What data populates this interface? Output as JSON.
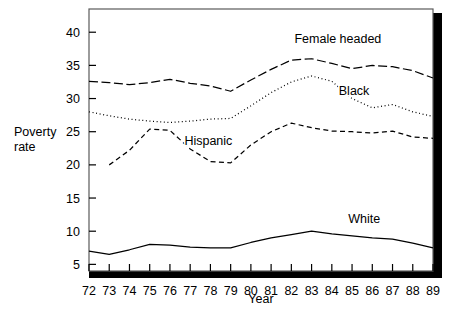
{
  "chart_data": {
    "type": "line",
    "title": "",
    "subtitle": "",
    "xlabel": "Year",
    "ylabel": "Poverty rate",
    "ylabel_line1": "Poverty",
    "ylabel_line2": "rate",
    "grid": false,
    "legend_position": "inline-annotations",
    "xlim": [
      72,
      89
    ],
    "ylim": [
      4.0,
      43.5
    ],
    "yticks": [
      5,
      10,
      15,
      20,
      25,
      30,
      35,
      40
    ],
    "ytick_labels": [
      "5",
      "10",
      "15",
      "20",
      "25",
      "30",
      "35",
      "40"
    ],
    "x": [
      72,
      73,
      74,
      75,
      76,
      77,
      78,
      79,
      80,
      81,
      82,
      83,
      84,
      85,
      86,
      87,
      88,
      89
    ],
    "categories": [
      "72",
      "73",
      "74",
      "75",
      "76",
      "77",
      "78",
      "79",
      "80",
      "81",
      "82",
      "83",
      "84",
      "85",
      "86",
      "87",
      "88",
      "89"
    ],
    "series": [
      {
        "name": "Female headed",
        "label": "Female headed",
        "style": "dash-dot",
        "color": "#000000",
        "values": [
          32.6,
          32.4,
          32.1,
          32.4,
          32.9,
          32.3,
          31.9,
          31.1,
          32.8,
          34.4,
          35.8,
          36.0,
          35.3,
          34.5,
          35.0,
          34.8,
          34.2,
          33.1
        ]
      },
      {
        "name": "Black",
        "label": "Black",
        "style": "dotted",
        "color": "#000000",
        "values": [
          28.0,
          27.4,
          26.9,
          26.6,
          26.4,
          26.6,
          26.9,
          27.0,
          28.9,
          30.9,
          32.5,
          33.4,
          32.6,
          30.0,
          28.6,
          29.1,
          28.0,
          27.3
        ]
      },
      {
        "name": "Hispanic",
        "label": "Hispanic",
        "style": "dashed",
        "color": "#000000",
        "values": [
          null,
          20.0,
          22.2,
          25.4,
          25.2,
          22.4,
          20.5,
          20.3,
          23.0,
          25.0,
          26.3,
          25.6,
          25.1,
          25.0,
          24.8,
          25.1,
          24.2,
          24.0
        ]
      },
      {
        "name": "White",
        "label": "White",
        "style": "solid",
        "color": "#000000",
        "values": [
          7.0,
          6.5,
          7.2,
          8.0,
          7.9,
          7.6,
          7.5,
          7.5,
          8.3,
          9.0,
          9.5,
          10.0,
          9.6,
          9.3,
          9.0,
          8.8,
          8.2,
          7.5
        ]
      }
    ],
    "annotations": [
      {
        "name": "female-headed-label",
        "text": "Female headed",
        "x": 84.3,
        "y": 38.3
      },
      {
        "name": "black-label",
        "text": "Black",
        "x": 85.1,
        "y": 30.5
      },
      {
        "name": "hispanic-label",
        "text": "Hispanic",
        "x": 77.9,
        "y": 23.0
      },
      {
        "name": "white-label",
        "text": "White",
        "x": 85.6,
        "y": 11.2
      }
    ]
  },
  "axes": {
    "x_axis_title": "Year",
    "y_axis_title_line1": "Poverty",
    "y_axis_title_line2": "rate",
    "x_tick_labels": [
      "72",
      "73",
      "74",
      "75",
      "76",
      "77",
      "78",
      "79",
      "80",
      "81",
      "82",
      "83",
      "84",
      "85",
      "86",
      "87",
      "88",
      "89"
    ],
    "y_tick_labels": [
      "40",
      "35",
      "30",
      "25",
      "20",
      "15",
      "10",
      "5"
    ]
  },
  "style": {
    "background": "#ffffff",
    "ink": "#000000",
    "frame": "#4d4d4d",
    "shadow": "#000000"
  }
}
